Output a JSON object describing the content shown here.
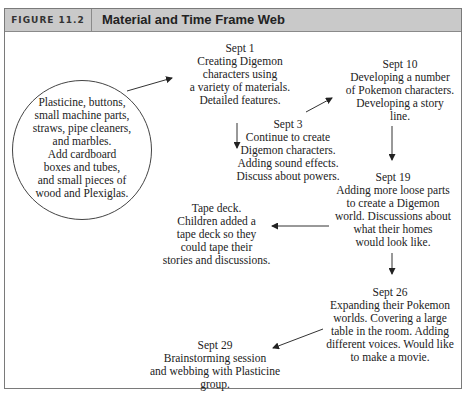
{
  "figure": {
    "label": "FIGURE 11.2",
    "title": "Material and Time Frame Web"
  },
  "nodes": {
    "materials": "Plasticine, buttons,\nsmall machine parts,\nstraws, pipe cleaners,\nand marbles.\nAdd cardboard\nboxes and tubes,\nand small pieces of\nwood and Plexiglas.",
    "sept1": "Sept 1\nCreating Digemon\ncharacters using\na variety of materials.\nDetailed features.",
    "sept3": "Sept 3\nContinue to create\nDigemon characters.\nAdding sound effects.\nDiscuss about powers.",
    "sept10": "Sept 10\nDeveloping a number\nof Pokemon characters.\nDeveloping a story\nline.",
    "sept19": "Sept 19\nAdding more loose parts\nto create a Digemon\nworld. Discussions about\nwhat their homes\nwould look like.",
    "tape_deck": "Tape deck.\nChildren added a\ntape deck so they\ncould tape their\nstories and discussions.",
    "sept26": "Sept 26\nExpanding their Pokemon\nworlds. Covering a large\ntable in the room. Adding\ndifferent voices. Would like\nto make a movie.",
    "sept29": "Sept 29\nBrainstorming session\nand webbing with Plasticine\ngroup."
  },
  "colors": {
    "header_bg": "#c9c9c9",
    "border": "#7a7a7a",
    "text": "#222222"
  }
}
